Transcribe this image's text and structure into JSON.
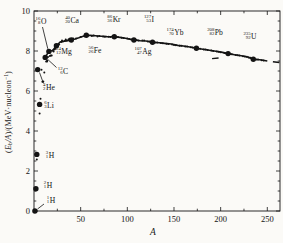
{
  "chart_data": {
    "type": "scatter",
    "xlabel": "A",
    "ylabel_plain": "(Eb/A)/(MeV·nucleon−1)",
    "ylabel_parts": {
      "open": "(",
      "E": "E",
      "sub_b": "b",
      "slashA": "/A",
      "mid": ")/(MeV·nucleon",
      "exp": "−1",
      "close": ")"
    },
    "xlim": [
      0,
      263.6
    ],
    "ylim": [
      0,
      10
    ],
    "x_major_ticks": [
      50,
      100,
      150,
      200,
      250
    ],
    "x_minor_ticks": [
      25,
      75,
      125,
      175,
      225
    ],
    "y_major_ticks": [
      0,
      2,
      4,
      6,
      8,
      10
    ],
    "y_minor_step": 0.5,
    "grid": false,
    "frame": true,
    "colors": {
      "ink": "#141414",
      "paper": "#fbfaf7"
    },
    "labeled_points": [
      {
        "mass": "1",
        "z": "1",
        "symbol": "H",
        "A": 1,
        "E": 0.0,
        "lx": 51,
        "ly": 200,
        "leader": [
          44,
          204,
          37.5,
          209
        ]
      },
      {
        "mass": "2",
        "z": "1",
        "symbol": "H",
        "A": 2,
        "E": 1.11,
        "lx": 48,
        "ly": 185
      },
      {
        "mass": "3",
        "z": "1",
        "symbol": "H",
        "A": 3,
        "E": 2.83,
        "lx": 50,
        "ly": 155
      },
      {
        "mass": "4",
        "z": "2",
        "symbol": "He",
        "A": 4,
        "E": 7.07,
        "lx": 49,
        "ly": 87,
        "leader": [
          43.5,
          83.5,
          39.5,
          72.5
        ]
      },
      {
        "mass": "6",
        "z": "3",
        "symbol": "Li",
        "A": 6,
        "E": 5.33,
        "lx": 49,
        "ly": 105
      },
      {
        "mass": "12",
        "z": "6",
        "symbol": "C",
        "A": 12,
        "E": 7.68,
        "lx": 63,
        "ly": 71,
        "leader": [
          56.5,
          67.5,
          47.8,
          59.5
        ]
      },
      {
        "mass": "16",
        "z": "8",
        "symbol": "O",
        "A": 16,
        "E": 7.98,
        "lx": 41,
        "ly": 21,
        "leader": [
          42.5,
          27,
          47.8,
          48.8
        ]
      },
      {
        "mass": "24",
        "z": "12",
        "symbol": "Mg",
        "A": 24,
        "E": 8.26,
        "lx": 64,
        "ly": 51
      },
      {
        "mass": "40",
        "z": "20",
        "symbol": "Ca",
        "A": 40,
        "E": 8.55,
        "lx": 72,
        "ly": 20
      },
      {
        "mass": "56",
        "z": "26",
        "symbol": "Fe",
        "A": 56,
        "E": 8.79,
        "lx": 95,
        "ly": 50
      },
      {
        "mass": "86",
        "z": "36",
        "symbol": "Kr",
        "A": 86,
        "E": 8.71,
        "lx": 114,
        "ly": 19
      },
      {
        "mass": "107",
        "z": "47",
        "symbol": "Ag",
        "A": 107,
        "E": 8.55,
        "lx": 143,
        "ly": 51
      },
      {
        "mass": "127",
        "z": "53",
        "symbol": "I",
        "A": 127,
        "E": 8.44,
        "lx": 149,
        "ly": 19
      },
      {
        "mass": "174",
        "z": "70",
        "symbol": "Yb",
        "A": 174,
        "E": 8.14,
        "lx": 175,
        "ly": 32
      },
      {
        "mass": "208",
        "z": "82",
        "symbol": "Pb",
        "A": 208,
        "E": 7.87,
        "lx": 215,
        "ly": 32
      },
      {
        "mass": "235",
        "z": "92",
        "symbol": "U",
        "A": 235,
        "E": 7.59,
        "lx": 250,
        "ly": 36
      }
    ],
    "curve": [
      [
        12,
        7.68
      ],
      [
        16,
        7.98
      ],
      [
        20,
        8.03
      ],
      [
        24,
        8.26
      ],
      [
        28,
        8.45
      ],
      [
        32,
        8.49
      ],
      [
        36,
        8.52
      ],
      [
        40,
        8.55
      ],
      [
        44,
        8.6
      ],
      [
        48,
        8.66
      ],
      [
        52,
        8.73
      ],
      [
        56,
        8.79
      ],
      [
        60,
        8.78
      ],
      [
        66,
        8.76
      ],
      [
        72,
        8.74
      ],
      [
        78,
        8.72
      ],
      [
        86,
        8.71
      ],
      [
        92,
        8.68
      ],
      [
        98,
        8.64
      ],
      [
        107,
        8.55
      ],
      [
        114,
        8.51
      ],
      [
        120,
        8.5
      ],
      [
        127,
        8.44
      ],
      [
        134,
        8.41
      ],
      [
        140,
        8.38
      ],
      [
        147,
        8.35
      ],
      [
        154,
        8.28
      ],
      [
        160,
        8.25
      ],
      [
        167,
        8.2
      ],
      [
        174,
        8.14
      ],
      [
        181,
        8.09
      ],
      [
        188,
        8.04
      ],
      [
        195,
        7.99
      ],
      [
        202,
        7.93
      ],
      [
        208,
        7.87
      ],
      [
        215,
        7.81
      ],
      [
        222,
        7.76
      ],
      [
        229,
        7.7
      ],
      [
        235,
        7.59
      ],
      [
        242,
        7.56
      ],
      [
        250,
        7.5
      ]
    ],
    "curve_tail": [
      [
        256,
        7.46
      ],
      [
        263,
        7.42
      ]
    ],
    "dash_marker": {
      "A": [
        190.8,
        197.8
      ],
      "E": [
        7.62,
        7.65
      ]
    },
    "scatter": [
      [
        3,
        2.57
      ],
      [
        6,
        4.88
      ],
      [
        7,
        5.61
      ],
      [
        7,
        5.37
      ],
      [
        8,
        7.06
      ],
      [
        9,
        6.46
      ],
      [
        10,
        6.48
      ],
      [
        11,
        6.93
      ],
      [
        13,
        7.47
      ],
      [
        14,
        7.52
      ],
      [
        14,
        7.48
      ],
      [
        15,
        7.7
      ],
      [
        17,
        7.75
      ],
      [
        18,
        7.77
      ],
      [
        19,
        7.78
      ],
      [
        20,
        8.03
      ],
      [
        21,
        7.97
      ],
      [
        22,
        8.08
      ],
      [
        23,
        8.11
      ],
      [
        25,
        8.22
      ],
      [
        26,
        8.33
      ],
      [
        27,
        8.33
      ],
      [
        29,
        8.45
      ],
      [
        30,
        8.52
      ],
      [
        31,
        8.48
      ],
      [
        33,
        8.5
      ],
      [
        34,
        8.58
      ],
      [
        35,
        8.52
      ],
      [
        37,
        8.57
      ],
      [
        38,
        8.61
      ],
      [
        39,
        8.56
      ],
      [
        42,
        8.62
      ],
      [
        45,
        8.62
      ],
      [
        50,
        8.7
      ],
      [
        54,
        8.74
      ],
      [
        58,
        8.77
      ],
      [
        62,
        8.75
      ],
      [
        64,
        8.78
      ],
      [
        68,
        8.73
      ],
      [
        70,
        8.75
      ],
      [
        74,
        8.72
      ],
      [
        76,
        8.71
      ],
      [
        80,
        8.71
      ],
      [
        82,
        8.7
      ],
      [
        84,
        8.72
      ],
      [
        88,
        8.69
      ],
      [
        90,
        8.7
      ],
      [
        94,
        8.66
      ],
      [
        96,
        8.65
      ],
      [
        100,
        8.62
      ],
      [
        102,
        8.6
      ],
      [
        104,
        8.58
      ],
      [
        110,
        8.55
      ],
      [
        112,
        8.53
      ],
      [
        116,
        8.52
      ],
      [
        118,
        8.52
      ],
      [
        122,
        8.48
      ],
      [
        124,
        8.47
      ],
      [
        130,
        8.43
      ],
      [
        132,
        8.42
      ],
      [
        136,
        8.4
      ],
      [
        138,
        8.39
      ],
      [
        142,
        8.36
      ],
      [
        144,
        8.35
      ],
      [
        148,
        8.32
      ],
      [
        150,
        8.3
      ],
      [
        152,
        8.29
      ],
      [
        156,
        8.26
      ],
      [
        158,
        8.26
      ],
      [
        162,
        8.23
      ],
      [
        164,
        8.22
      ],
      [
        168,
        8.19
      ],
      [
        170,
        8.18
      ],
      [
        176,
        8.12
      ],
      [
        178,
        8.11
      ],
      [
        182,
        8.08
      ],
      [
        184,
        8.07
      ],
      [
        186,
        8.05
      ],
      [
        190,
        8.02
      ],
      [
        192,
        8.0
      ],
      [
        196,
        7.98
      ],
      [
        198,
        7.96
      ],
      [
        200,
        7.94
      ],
      [
        204,
        7.9
      ],
      [
        206,
        7.89
      ],
      [
        210,
        7.85
      ],
      [
        212,
        7.84
      ],
      [
        216,
        7.8
      ],
      [
        218,
        7.79
      ],
      [
        220,
        7.77
      ],
      [
        224,
        7.74
      ],
      [
        226,
        7.72
      ],
      [
        228,
        7.71
      ],
      [
        230,
        7.68
      ],
      [
        232,
        7.66
      ],
      [
        238,
        7.58
      ],
      [
        240,
        7.57
      ],
      [
        244,
        7.54
      ],
      [
        246,
        7.53
      ]
    ]
  }
}
